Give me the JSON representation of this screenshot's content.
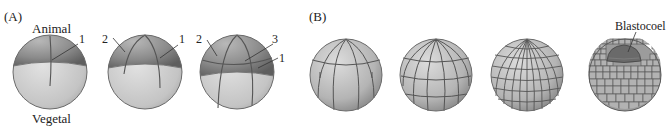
{
  "panel_a": {
    "label": "(A)",
    "pole_top": "Animal",
    "pole_bottom": "Vegetal",
    "embryos": [
      {
        "stage": "2-cell",
        "furrow_labels": [
          "1"
        ]
      },
      {
        "stage": "4-cell",
        "furrow_labels": [
          "2",
          "1"
        ]
      },
      {
        "stage": "8-cell",
        "furrow_labels": [
          "2",
          "3",
          "1"
        ]
      }
    ]
  },
  "panel_b": {
    "label": "(B)",
    "embryos": [
      {
        "stage": "16-cell"
      },
      {
        "stage": "32-cell"
      },
      {
        "stage": "morula"
      },
      {
        "stage": "blastula",
        "annotation": "Blastocoel"
      }
    ]
  },
  "colors": {
    "animal_shade": "#8f8f8f",
    "vegetal_shade": "#c9c9c9",
    "furrow": "#555555",
    "text": "#222222"
  }
}
